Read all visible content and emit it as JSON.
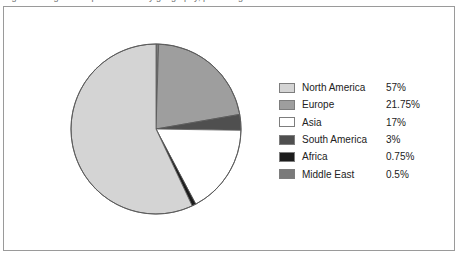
{
  "caption": {
    "text": "Figure 1: Regional shipment share by geography, percentage of total units"
  },
  "chart_data": {
    "type": "pie",
    "title": "",
    "legend_position": "right",
    "start_angle_deg": 0,
    "direction": "clockwise",
    "categories": [
      "North America",
      "Europe",
      "Asia",
      "South America",
      "Africa",
      "Middle East"
    ],
    "values": [
      57,
      21.75,
      17,
      3,
      0.75,
      0.5
    ],
    "value_labels": [
      "57%",
      "21.75%",
      "17%",
      "3%",
      "0.75%",
      "0.5%"
    ],
    "colors": [
      "#d4d4d4",
      "#9e9e9e",
      "#ffffff",
      "#4f4f4f",
      "#1c1c1c",
      "#7a7a7a"
    ],
    "slice_order_clockwise": [
      "Middle East",
      "Europe",
      "South America",
      "Asia",
      "Africa",
      "North America"
    ],
    "slice_border_color": "#5a5a5a",
    "unit": "%"
  },
  "legend": {
    "rows": [
      {
        "label": "North America",
        "value": "57%",
        "color": "#d4d4d4"
      },
      {
        "label": "Europe",
        "value": "21.75%",
        "color": "#9e9e9e"
      },
      {
        "label": "Asia",
        "value": "17%",
        "color": "#ffffff"
      },
      {
        "label": "South America",
        "value": "3%",
        "color": "#4f4f4f"
      },
      {
        "label": "Africa",
        "value": "0.75%",
        "color": "#1c1c1c"
      },
      {
        "label": "Middle East",
        "value": "0.5%",
        "color": "#7a7a7a"
      }
    ]
  },
  "frame": {
    "border_color": "#9a9a9a",
    "background": "#ffffff"
  }
}
